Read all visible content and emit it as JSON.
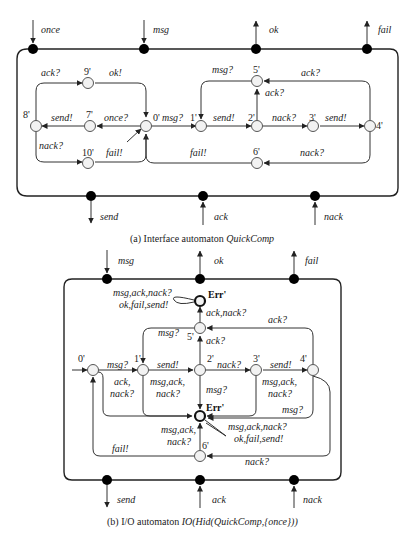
{
  "figure_a": {
    "caption_prefix": "(a) Interface automaton ",
    "caption_name": "QuickComp",
    "top_ports": [
      {
        "name": "once",
        "direction": "input"
      },
      {
        "name": "msg",
        "direction": "input"
      },
      {
        "name": "ok",
        "direction": "output"
      },
      {
        "name": "fail",
        "direction": "output"
      }
    ],
    "bottom_ports": [
      {
        "name": "send",
        "direction": "output"
      },
      {
        "name": "ack",
        "direction": "input"
      },
      {
        "name": "nack",
        "direction": "input"
      }
    ],
    "states": [
      "0'",
      "1'",
      "2'",
      "3'",
      "4'",
      "5'",
      "6'",
      "7'",
      "8'",
      "9'",
      "10'"
    ],
    "transitions": [
      {
        "from": "0'",
        "to": "1'",
        "label": "msg?"
      },
      {
        "from": "1'",
        "to": "2'",
        "label": "send!"
      },
      {
        "from": "2'",
        "to": "3'",
        "label": "nack?"
      },
      {
        "from": "3'",
        "to": "4'",
        "label": "send!"
      },
      {
        "from": "4'",
        "to": "5'",
        "label": "ack?"
      },
      {
        "from": "2'",
        "to": "5'",
        "label": "ack?"
      },
      {
        "from": "5'",
        "to": "1'",
        "label": "msg?"
      },
      {
        "from": "4'",
        "to": "6'",
        "label": "nack?"
      },
      {
        "from": "6'",
        "to": "0'",
        "label": "fail!"
      },
      {
        "from": "0'",
        "to": "7'",
        "label": "once?"
      },
      {
        "from": "7'",
        "to": "8'",
        "label": "send!"
      },
      {
        "from": "8'",
        "to": "9'",
        "label": "ack?"
      },
      {
        "from": "9'",
        "to": "0'",
        "label": "ok!"
      },
      {
        "from": "8'",
        "to": "10'",
        "label": "nack?"
      },
      {
        "from": "10'",
        "to": "0'",
        "label": "fail!"
      }
    ]
  },
  "figure_b": {
    "caption_prefix": "(b) I/O automaton ",
    "caption_name": "IO(Hid(QuickComp,{once}))",
    "top_ports": [
      {
        "name": "msg",
        "direction": "input"
      },
      {
        "name": "ok",
        "direction": "output"
      },
      {
        "name": "fail",
        "direction": "output"
      }
    ],
    "bottom_ports": [
      {
        "name": "send",
        "direction": "output"
      },
      {
        "name": "ack",
        "direction": "input"
      },
      {
        "name": "nack",
        "direction": "input"
      }
    ],
    "states": [
      "0'",
      "1'",
      "2'",
      "3'",
      "4'",
      "5'",
      "6'",
      "Err'"
    ],
    "err_label": "Err'",
    "transitions": [
      {
        "from": "0'",
        "to": "1'",
        "label": "msg?"
      },
      {
        "from": "1'",
        "to": "2'",
        "label": "send!"
      },
      {
        "from": "2'",
        "to": "3'",
        "label": "nack?"
      },
      {
        "from": "3'",
        "to": "4'",
        "label": "send!"
      },
      {
        "from": "4'",
        "to": "5'",
        "label": "ack?"
      },
      {
        "from": "2'",
        "to": "5'",
        "label": "ack?"
      },
      {
        "from": "5'",
        "to": "1'",
        "label": "msg?"
      },
      {
        "from": "5'",
        "to": "Err'",
        "label": "ack,nack?"
      },
      {
        "from": "Err'",
        "to": "Err'",
        "label": "msg,ack,nack? ok,fail,send!"
      },
      {
        "from": "0'",
        "to": "0'",
        "label": "ack, nack?"
      },
      {
        "from": "1'",
        "to": "Err'",
        "label": "msg,ack, nack?"
      },
      {
        "from": "2'",
        "to": "Err'",
        "label": "msg?"
      },
      {
        "from": "3'",
        "to": "Err'",
        "label": "msg,ack, nack?"
      },
      {
        "from": "4'",
        "to": "Err'",
        "label": "msg?"
      },
      {
        "from": "6'",
        "to": "Err'",
        "label": "msg,ack, nack?"
      },
      {
        "from": "4'",
        "to": "6'",
        "label": "nack?"
      },
      {
        "from": "6'",
        "to": "0'",
        "label": "fail!"
      }
    ],
    "labels": {
      "err_self_loop_top_1": "msg,ack,nack?",
      "err_self_loop_top_2": "ok,fail,send!",
      "ack_nack": "ack,nack?",
      "ack_top": "ack?",
      "msg_5_1": "msg?",
      "ack_2_5": "ack?",
      "msg_0_1": "msg?",
      "send_1_2": "send!",
      "nack_2_3": "nack?",
      "send_3_4": "send!",
      "ack0_1": "ack,",
      "ack0_2": "nack?",
      "err1_1": "msg,ack,",
      "err1_2": "nack?",
      "msg_2_err": "msg?",
      "err3_1": "msg,ack,",
      "err3_2": "nack?",
      "msg_4_err": "msg?",
      "err6_1": "msg,ack,",
      "err6_2": "nack?",
      "err_self_bottom_1": "msg,ack,nack?",
      "err_self_bottom_2": "ok,fail,send!",
      "fail": "fail!",
      "nack_4_6": "nack?"
    }
  }
}
